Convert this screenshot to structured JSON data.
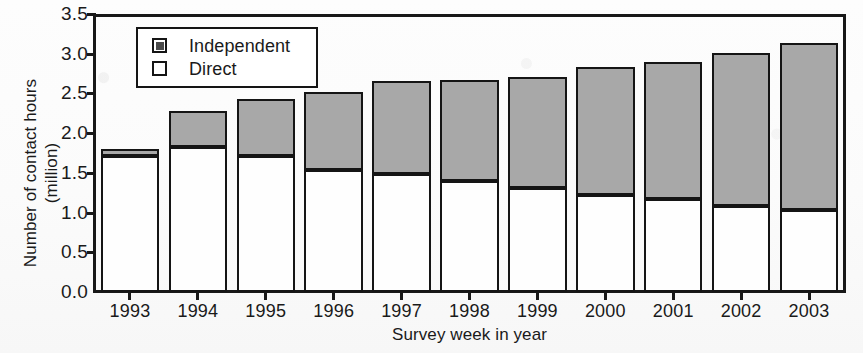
{
  "chart_data": {
    "type": "bar",
    "subtype": "stacked",
    "title": "",
    "xlabel": "Survey week in year",
    "ylabel": "Number of contact hours (million)",
    "ylabel_line1": "Number of contact hours",
    "ylabel_line2": "(million)",
    "categories": [
      "1993",
      "1994",
      "1995",
      "1996",
      "1997",
      "1998",
      "1999",
      "2000",
      "2001",
      "2002",
      "2003"
    ],
    "series": [
      {
        "name": "Direct",
        "color": "#fefefe",
        "values": [
          1.71,
          1.82,
          1.71,
          1.54,
          1.49,
          1.4,
          1.31,
          1.22,
          1.17,
          1.08,
          1.03
        ]
      },
      {
        "name": "Independent",
        "color": "#a8a8a8",
        "values": [
          0.06,
          0.43,
          0.69,
          0.95,
          1.14,
          1.24,
          1.36,
          1.58,
          1.69,
          1.9,
          2.08
        ]
      }
    ],
    "totals": [
      1.77,
      2.25,
      2.4,
      2.49,
      2.63,
      2.64,
      2.67,
      2.8,
      2.86,
      2.98,
      3.11
    ],
    "ylim": [
      0.0,
      3.5
    ],
    "yticks": [
      "0.0",
      "0.5",
      "1.0",
      "1.5",
      "2.0",
      "2.5",
      "3.0",
      "3.5"
    ],
    "ytick_values": [
      0.0,
      0.5,
      1.0,
      1.5,
      2.0,
      2.5,
      3.0,
      3.5
    ],
    "grid": false,
    "legend_position": "top-left-inside",
    "legend_entries": [
      "Independent",
      "Direct"
    ],
    "frame_color": "#181818",
    "bar_edge_color": "#151515"
  }
}
